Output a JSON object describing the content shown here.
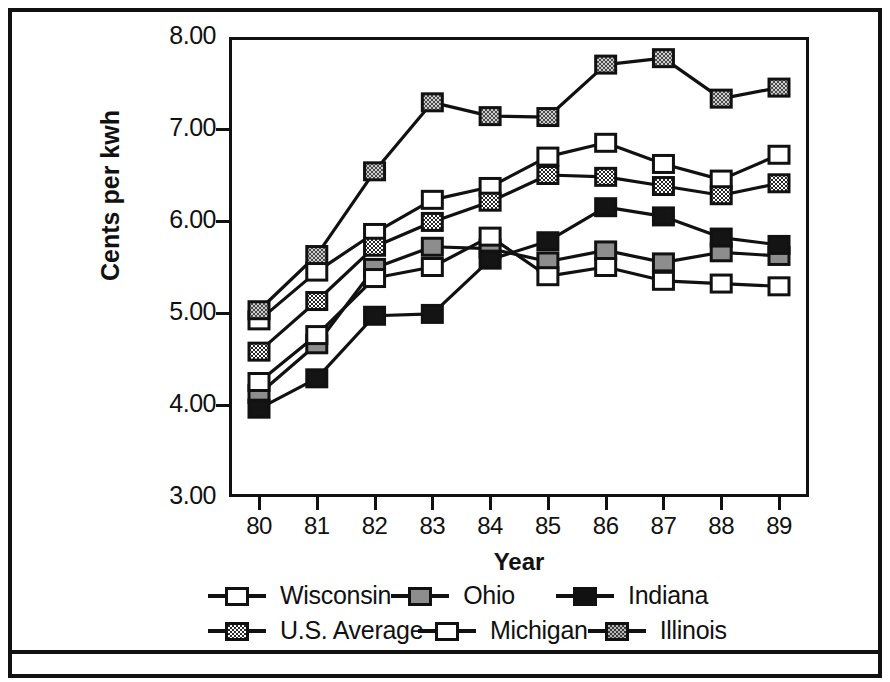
{
  "chart_data": {
    "type": "line",
    "title": "",
    "xlabel": "Year",
    "ylabel": "Cents per kwh",
    "x": [
      "80",
      "81",
      "82",
      "83",
      "84",
      "85",
      "86",
      "87",
      "88",
      "89"
    ],
    "categories": [
      "80",
      "81",
      "82",
      "83",
      "84",
      "85",
      "86",
      "87",
      "88",
      "89"
    ],
    "ylim": [
      3.0,
      8.0
    ],
    "ytick_labels": [
      "8.00",
      "7.00",
      "6.00",
      "5.00",
      "4.00",
      "3.00"
    ],
    "ytick_values": [
      8.0,
      7.0,
      6.0,
      5.0,
      4.0,
      3.0
    ],
    "grid": false,
    "legend_position": "bottom",
    "series": [
      {
        "name": "Wisconsin",
        "marker": "white-square",
        "color": "#ffffff",
        "values": [
          4.92,
          5.45,
          5.87,
          6.23,
          6.37,
          6.7,
          6.85,
          6.62,
          6.45,
          6.72
        ]
      },
      {
        "name": "Ohio",
        "marker": "gray-square",
        "color": "#8d8d8d",
        "values": [
          4.12,
          4.66,
          5.49,
          5.72,
          5.7,
          5.56,
          5.68,
          5.55,
          5.66,
          5.62
        ]
      },
      {
        "name": "Indiana",
        "marker": "black-square",
        "color": "#111111",
        "values": [
          3.96,
          4.29,
          4.97,
          4.99,
          5.58,
          5.78,
          6.15,
          6.05,
          5.82,
          5.74
        ]
      },
      {
        "name": "U.S. Average",
        "marker": "checker-square",
        "color": "#2b2b2b",
        "values": [
          4.58,
          5.13,
          5.72,
          5.99,
          6.21,
          6.5,
          6.48,
          6.38,
          6.28,
          6.41
        ]
      },
      {
        "name": "Michigan",
        "marker": "white-square",
        "color": "#ffffff",
        "values": [
          4.25,
          4.76,
          5.38,
          5.5,
          5.83,
          5.4,
          5.5,
          5.35,
          5.32,
          5.29
        ]
      },
      {
        "name": "Illinois",
        "marker": "stipple-square",
        "color": "#b9b9b9",
        "values": [
          5.03,
          5.63,
          6.54,
          7.29,
          7.14,
          7.13,
          7.7,
          7.77,
          7.33,
          7.45
        ]
      }
    ]
  },
  "axes": {
    "y_label": "Cents per kwh",
    "x_label": "Year",
    "y_ticks": [
      "8.00",
      "7.00",
      "6.00",
      "5.00",
      "4.00",
      "3.00"
    ],
    "x_ticks": [
      "80",
      "81",
      "82",
      "83",
      "84",
      "85",
      "86",
      "87",
      "88",
      "89"
    ]
  },
  "legend": {
    "rows": [
      [
        {
          "label": "Wisconsin",
          "swatch": "white-square"
        },
        {
          "label": "Ohio",
          "swatch": "gray-square"
        },
        {
          "label": "Indiana",
          "swatch": "black-square"
        }
      ],
      [
        {
          "label": "U.S. Average",
          "swatch": "checker-square"
        },
        {
          "label": "Michigan",
          "swatch": "white-square"
        },
        {
          "label": "Illinois",
          "swatch": "stipple-square"
        }
      ]
    ]
  }
}
